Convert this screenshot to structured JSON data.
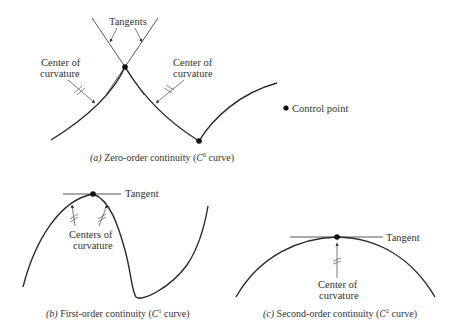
{
  "figure": {
    "panel_a": {
      "caption_prefix": "(a)",
      "caption_text": " Zero-order continuity (",
      "caption_c": "C",
      "caption_sup": "0",
      "caption_suffix": " curve)",
      "tangents_label": "Tangents",
      "left_center_label_line1": "Center of",
      "left_center_label_line2": "curvature",
      "right_center_label_line1": "Center of",
      "right_center_label_line2": "curvature"
    },
    "legend": {
      "control_point_label": "Control point"
    },
    "panel_b": {
      "caption_prefix": "(b)",
      "caption_text": " First-order continuity (",
      "caption_c": "C",
      "caption_sup": "1",
      "caption_suffix": " curve)",
      "tangent_label": "Tangent",
      "centers_label_line1": "Centers of",
      "centers_label_line2": "curvature"
    },
    "panel_c": {
      "caption_prefix": "(c)",
      "caption_text": " Second-order continuity (",
      "caption_c": "C",
      "caption_sup": "2",
      "caption_suffix": " curve)",
      "tangent_label": "Tangent",
      "center_label_line1": "Center of",
      "center_label_line2": "curvature"
    },
    "colors": {
      "line": "#2a2a2a",
      "text": "#333333",
      "background": "#ffffff"
    }
  }
}
